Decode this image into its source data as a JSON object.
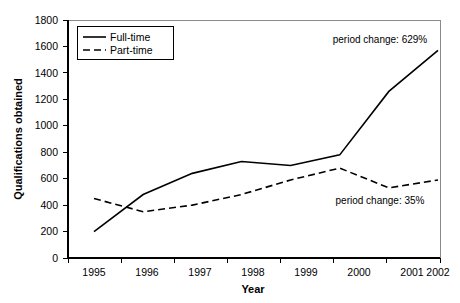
{
  "chart_data": {
    "type": "line",
    "title": "",
    "xlabel": "Year",
    "ylabel": "Qualifications obtained",
    "categories": [
      "1995",
      "1996",
      "1997",
      "1998",
      "1999",
      "2000",
      "2001",
      "2002"
    ],
    "x": [
      1995,
      1996,
      1997,
      1998,
      1999,
      2000,
      2001,
      2002
    ],
    "xlim": [
      1995,
      2002
    ],
    "ylim": [
      0,
      1800
    ],
    "ytick_step": 200,
    "yticks": [
      "0",
      "200",
      "400",
      "600",
      "800",
      "1000",
      "1200",
      "1400",
      "1600",
      "1800"
    ],
    "ytick_values": [
      0,
      200,
      400,
      600,
      800,
      1000,
      1200,
      1400,
      1600,
      1800
    ],
    "grid": false,
    "legend_position": "top-left",
    "series": [
      {
        "name": "Full-time",
        "style": "solid",
        "color": "#000000",
        "values": [
          200,
          480,
          640,
          730,
          700,
          780,
          1260,
          1570
        ]
      },
      {
        "name": "Part-time",
        "style": "dashed",
        "color": "#000000",
        "values": [
          450,
          350,
          400,
          480,
          590,
          680,
          530,
          590
        ]
      }
    ],
    "annotations": [
      {
        "text": "period change: 629%",
        "series": "Full-time",
        "x_px": 380,
        "y_px": 43
      },
      {
        "text": "period change: 35%",
        "series": "Part-time",
        "x_px": 380,
        "y_px": 204
      }
    ]
  }
}
